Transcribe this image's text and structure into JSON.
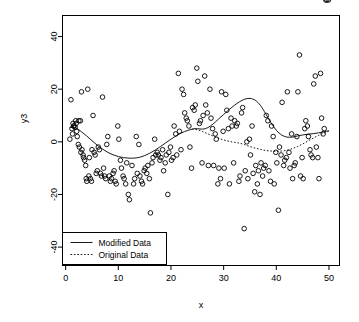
{
  "chart_data": {
    "type": "scatter",
    "title": "",
    "xlabel": "x",
    "ylabel": "y3",
    "xlim": [
      -0.6,
      52.0
    ],
    "ylim": [
      -47,
      48
    ],
    "xticks": [
      0,
      10,
      20,
      30,
      40,
      50
    ],
    "yticks": [
      -40,
      -20,
      0,
      20,
      40
    ],
    "xticklabels": [
      "0",
      "10",
      "20",
      "30",
      "40",
      "50"
    ],
    "yticklabels": [
      "-40",
      "-20",
      "0",
      "20",
      "40"
    ],
    "grid": false,
    "point_marker": "open-circle",
    "point_color": "#000000",
    "legend": {
      "position": "bottom-left",
      "entries": [
        {
          "label": "Modified Data",
          "style": "solid"
        },
        {
          "label": "Original Data",
          "style": "dotted"
        }
      ]
    },
    "scatter": {
      "name": "y3 observations",
      "x": [
        0.8,
        1.0,
        1.2,
        1.3,
        1.4,
        1.5,
        1.6,
        1.8,
        1.9,
        2.0,
        2.1,
        2.2,
        2.4,
        2.5,
        2.6,
        2.8,
        2.9,
        3.0,
        3.1,
        3.3,
        3.4,
        3.6,
        3.8,
        3.9,
        4.0,
        4.2,
        4.4,
        4.5,
        4.7,
        4.9,
        5.0,
        5.2,
        5.4,
        5.6,
        5.8,
        6.0,
        6.2,
        6.4,
        6.6,
        6.8,
        7.0,
        7.2,
        7.4,
        7.6,
        7.8,
        8.0,
        8.3,
        8.5,
        8.7,
        9.0,
        9.2,
        9.4,
        9.6,
        9.9,
        10.1,
        10.4,
        10.6,
        10.9,
        11.1,
        11.4,
        11.6,
        11.9,
        12.1,
        12.4,
        12.6,
        12.9,
        13.1,
        13.4,
        13.6,
        13.9,
        14.1,
        14.4,
        14.6,
        14.9,
        15.1,
        15.4,
        15.6,
        15.9,
        16.1,
        16.4,
        16.6,
        16.9,
        17.1,
        17.4,
        17.6,
        17.9,
        18.1,
        18.4,
        18.6,
        18.9,
        19.1,
        19.4,
        19.6,
        19.9,
        20.1,
        20.4,
        20.6,
        20.9,
        21.1,
        21.4,
        21.6,
        21.9,
        22.1,
        22.4,
        22.6,
        22.9,
        23.1,
        23.4,
        23.6,
        23.9,
        24.1,
        24.4,
        24.6,
        24.9,
        25.1,
        25.4,
        25.6,
        25.9,
        26.1,
        26.4,
        26.6,
        26.9,
        27.1,
        27.4,
        27.6,
        27.9,
        28.1,
        28.4,
        28.6,
        28.9,
        29.1,
        29.4,
        29.6,
        29.9,
        30.1,
        30.4,
        30.6,
        30.9,
        31.1,
        31.4,
        31.6,
        31.9,
        32.1,
        32.4,
        32.6,
        32.9,
        33.1,
        33.4,
        33.6,
        33.9,
        34.1,
        34.4,
        34.6,
        34.9,
        35.1,
        35.4,
        35.6,
        35.9,
        36.1,
        36.4,
        36.6,
        36.9,
        37.1,
        37.4,
        37.6,
        37.9,
        38.1,
        38.4,
        38.6,
        38.9,
        39.1,
        39.4,
        39.6,
        39.9,
        40.1,
        40.4,
        40.6,
        40.9,
        41.1,
        41.4,
        41.6,
        41.9,
        42.1,
        42.4,
        42.6,
        42.9,
        43.1,
        43.4,
        43.6,
        43.9,
        44.1,
        44.4,
        44.6,
        44.9,
        45.1,
        45.4,
        45.6,
        45.9,
        46.1,
        46.4,
        46.6,
        46.9,
        47.1,
        47.4,
        47.6,
        47.9,
        48.1,
        48.4,
        48.6,
        48.9,
        49.1,
        49.4,
        49.6,
        49.9
      ],
      "y": [
        1.0,
        16.0,
        5.0,
        3.0,
        7.0,
        6.0,
        6.0,
        5.5,
        8.0,
        7.0,
        4.0,
        2.0,
        -1.0,
        8.0,
        -2.0,
        8.0,
        -4.0,
        19.0,
        -3.0,
        -5.0,
        -6.0,
        -7.0,
        -9.0,
        -14.0,
        -15.0,
        20.0,
        -13.0,
        -6.0,
        -14.0,
        -15.0,
        -3.0,
        10.0,
        -4.0,
        -5.0,
        -12.0,
        -11.0,
        -2.0,
        -3.0,
        -12.0,
        -13.0,
        17.0,
        -10.0,
        -13.0,
        -14.0,
        -1.0,
        2.0,
        -13.0,
        -15.0,
        -14.0,
        -12.0,
        -11.0,
        -15.0,
        -16.0,
        6.0,
        1.0,
        -7.0,
        -10.0,
        -13.0,
        -14.0,
        -16.0,
        -8.0,
        -20.0,
        -22.0,
        -40.0,
        -9.0,
        -16.0,
        -14.0,
        2.0,
        -12.0,
        -1.0,
        -13.0,
        -15.0,
        -16.0,
        -11.0,
        -10.0,
        -12.0,
        -9.0,
        -14.0,
        -27.0,
        -8.0,
        -6.0,
        1.0,
        -5.0,
        -4.0,
        -5.0,
        -7.0,
        -6.0,
        -3.0,
        -11.0,
        -8.0,
        -5.0,
        -20.0,
        -4.0,
        -2.0,
        -7.0,
        -6.0,
        6.0,
        3.0,
        -5.0,
        26.0,
        4.0,
        -3.0,
        20.0,
        18.0,
        11.0,
        9.0,
        8.0,
        6.0,
        -2.0,
        -10.0,
        13.0,
        12.0,
        14.0,
        28.0,
        23.0,
        7.0,
        8.0,
        -8.0,
        10.0,
        25.0,
        14.0,
        11.0,
        -9.0,
        20.0,
        9.0,
        5.0,
        -9.0,
        3.0,
        1.0,
        -16.0,
        -10.0,
        -14.0,
        19.0,
        4.0,
        -10.0,
        18.0,
        12.0,
        5.0,
        -16.0,
        9.0,
        6.0,
        -8.0,
        8.0,
        6.0,
        7.0,
        -15.0,
        -13.0,
        11.0,
        13.0,
        -33.0,
        -11.0,
        0.0,
        -14.0,
        1.0,
        -5.0,
        6.0,
        -12.0,
        -19.0,
        -9.0,
        -16.0,
        -11.0,
        -20.0,
        -8.0,
        -13.0,
        -10.0,
        -9.0,
        10.0,
        8.0,
        -11.0,
        -15.0,
        6.0,
        2.0,
        -16.0,
        -4.0,
        -8.0,
        -26.0,
        -2.0,
        -5.0,
        15.0,
        -9.0,
        -7.0,
        -6.0,
        19.0,
        -4.0,
        -10.0,
        3.0,
        -14.0,
        -9.0,
        -8.0,
        2.0,
        19.0,
        33.0,
        -13.0,
        -6.0,
        -14.0,
        5.0,
        8.0,
        6.0,
        2.0,
        -3.0,
        -5.0,
        -6.0,
        22.0,
        25.0,
        -2.0,
        -6.0,
        -14.0,
        26.0,
        9.0,
        3.0,
        5.0
      ]
    },
    "series": [
      {
        "name": "Modified Data",
        "style": "solid",
        "x": [
          0.8,
          2,
          4,
          6,
          8,
          10,
          12,
          14,
          16,
          18,
          20,
          22,
          24,
          25,
          26,
          27,
          28,
          29,
          30,
          31,
          32,
          33,
          34,
          35,
          36,
          37,
          38,
          39,
          40,
          41,
          42,
          43,
          44,
          45,
          46,
          47,
          48,
          49,
          50
        ],
        "y": [
          5.5,
          5.2,
          2.2,
          -1.3,
          -4.0,
          -5.6,
          -6.2,
          -5.9,
          -4.3,
          -1.8,
          1.0,
          3.4,
          4.8,
          5.0,
          4.8,
          5.4,
          6.8,
          8.6,
          10.4,
          12.2,
          13.8,
          15.2,
          16.2,
          16.5,
          15.8,
          13.8,
          10.6,
          7.2,
          4.4,
          2.6,
          1.8,
          1.8,
          2.2,
          2.6,
          2.9,
          3.1,
          3.4,
          3.8,
          4.2
        ]
      },
      {
        "name": "Original Data",
        "style": "dotted",
        "x": [
          24,
          25,
          26,
          27,
          28,
          29,
          30,
          31,
          32,
          33,
          34,
          35,
          36,
          37,
          38,
          39,
          40,
          41,
          42,
          43,
          44,
          45,
          46,
          47,
          48,
          49,
          50
        ],
        "y": [
          4.8,
          4.6,
          3.9,
          3.0,
          2.2,
          1.4,
          0.7,
          0.2,
          -0.2,
          -0.5,
          -1.1,
          -1.8,
          -2.4,
          -2.9,
          -3.3,
          -3.5,
          -3.6,
          -3.5,
          -3.2,
          -2.6,
          -1.8,
          -0.8,
          0.3,
          1.4,
          2.4,
          3.3,
          4.1
        ]
      }
    ]
  }
}
